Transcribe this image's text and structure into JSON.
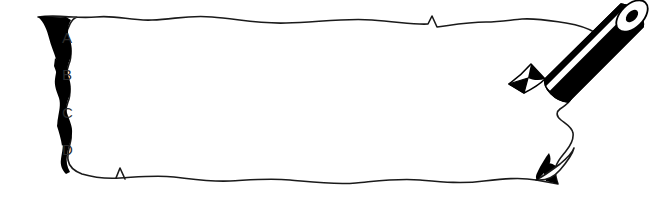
{
  "document": {
    "title": "Torn Paper Note",
    "kind": "torn-paper-answer-sheet"
  },
  "paper": {
    "fill_color": "#ffffff",
    "edge_color": "#1a1a1a",
    "tear_shadow_color": "#000000",
    "description": "Horizontal strip of torn notebook paper with ragged left edge, wavy top and bottom edges, and a folded curled corner at the bottom right."
  },
  "choices": {
    "list_name": "answer-choices",
    "items": [
      {
        "label": "A",
        "x": 62,
        "y": 43
      },
      {
        "label": "B",
        "x": 62,
        "y": 80
      },
      {
        "label": "C",
        "x": 62,
        "y": 118
      },
      {
        "label": "D",
        "x": 62,
        "y": 155
      }
    ]
  },
  "pencil": {
    "name": "pencil",
    "body_color": "#000000",
    "stripe_color": "#ffffff",
    "outline_color": "#000000",
    "tip_color": "#000000",
    "ferrule_hole_color": "#000000",
    "orientation": "diagonal, tip pointing lower-left",
    "description": "Striped pencil resting on the upper right corner of the paper, point touching the sheet."
  },
  "colors": {
    "background": "#ffffff",
    "ink": "#1a1a1a",
    "text": "#2b2b2b"
  }
}
